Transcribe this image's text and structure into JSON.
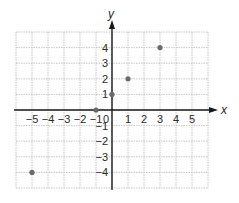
{
  "diagram": {
    "type": "coordinate-plane",
    "axes": {
      "x_label": "x",
      "y_label": "y"
    },
    "x_ticks": [
      "-5",
      "-4",
      "-3",
      "-2",
      "-1",
      "1",
      "2",
      "3",
      "4",
      "5"
    ],
    "y_ticks": [
      "4",
      "3",
      "2",
      "1",
      "-1",
      "-2",
      "-3",
      "-4"
    ],
    "origin_label": "0",
    "grid": {
      "x_range": [
        -6,
        6
      ],
      "y_range": [
        -5,
        5
      ],
      "line_color": "#b8b8b8"
    },
    "points": [
      {
        "x": -5,
        "y": -4
      },
      {
        "x": -1,
        "y": 0
      },
      {
        "x": 0,
        "y": 1
      },
      {
        "x": 1,
        "y": 2
      },
      {
        "x": 3,
        "y": 4
      }
    ],
    "point_color": "#6a6a6a",
    "axis_color": "#1a1a1a"
  }
}
